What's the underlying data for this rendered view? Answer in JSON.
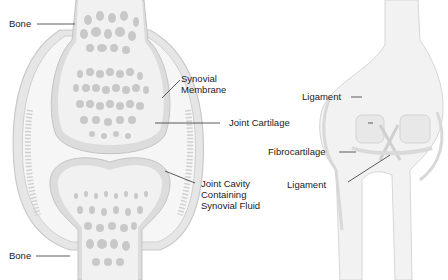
{
  "diagram": {
    "left_panel": {
      "subject": "synovial joint cross-section",
      "labels": {
        "bone_top": "Bone",
        "synovial_membrane_1": "Synovial",
        "synovial_membrane_2": "Membrane",
        "joint_cartilage": "Joint Cartilage",
        "joint_cavity_1": "Joint Cavity",
        "joint_cavity_2": "Containing",
        "joint_cavity_3": "Synovial Fluid",
        "bone_bottom": "Bone"
      }
    },
    "right_panel": {
      "subject": "knee joint front view",
      "labels": {
        "ligament_top": "Ligament",
        "fibrocartilage": "Fibrocartilage",
        "ligament_bottom": "Ligament"
      }
    },
    "colors": {
      "bone_fill": "#f1f1f1",
      "spongy_bone": "#c8c8c8",
      "cartilage": "#d9d9d9",
      "capsule": "#e2e2e2",
      "cavity": "#f4f4f4",
      "leader_line": "#333333",
      "text": "#222222"
    }
  }
}
